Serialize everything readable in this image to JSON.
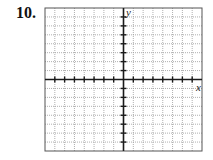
{
  "problem": {
    "number": "10."
  },
  "graph": {
    "x_axis_label": "x",
    "y_axis_label": "y",
    "grid": {
      "columns": 16,
      "rows": 16,
      "x_range": [
        -8,
        8
      ],
      "y_range": [
        -8,
        8
      ]
    },
    "colors": {
      "grid": "#9a9a9a",
      "axis": "#1a1a1a",
      "border": "#555555"
    }
  }
}
